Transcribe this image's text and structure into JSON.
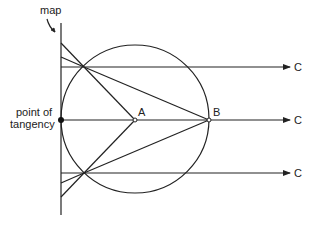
{
  "diagram": {
    "labels": {
      "map": "map",
      "point_of_tangency_line1": "point of",
      "point_of_tangency_line2": "tangency",
      "A": "A",
      "B": "B",
      "C_top": "C",
      "C_middle": "C",
      "C_bottom": "C"
    },
    "colors": {
      "stroke": "#222222",
      "background": "#ffffff"
    }
  }
}
